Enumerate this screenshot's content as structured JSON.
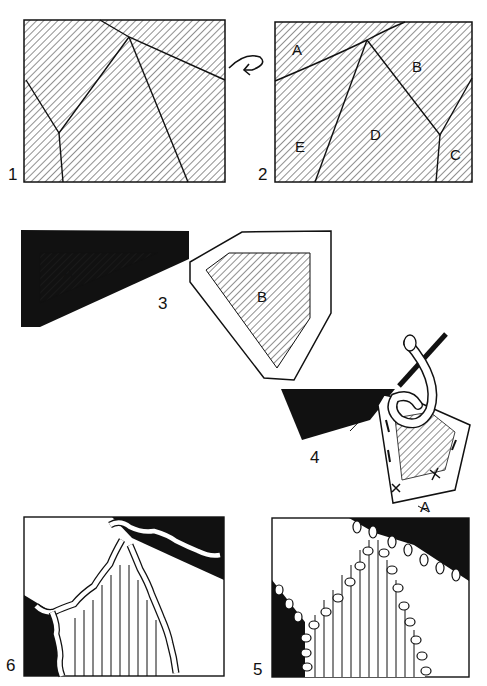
{
  "figures": [
    {
      "number": "1",
      "description": "hatched rectangle divided into pieces by lines"
    },
    {
      "number": "2",
      "description": "rectangle divided into labeled pieces",
      "piece_labels": [
        "A",
        "B",
        "C",
        "D",
        "E"
      ]
    },
    {
      "number": "3",
      "description": "pieces A and B cut with seam allowance",
      "piece_labels": [
        "A",
        "B"
      ]
    },
    {
      "number": "4",
      "description": "needle and thread joining pieces"
    },
    {
      "number": "5",
      "description": "completed join with buttonhole stitches",
      "pointer_label": "A"
    },
    {
      "number": "6",
      "description": "completed join with chain/cable stitches"
    }
  ],
  "arrow": {
    "name": "flip-arrow",
    "between": [
      "1",
      "2"
    ]
  },
  "colors": {
    "ink": "#111111",
    "paper": "#ffffff"
  }
}
